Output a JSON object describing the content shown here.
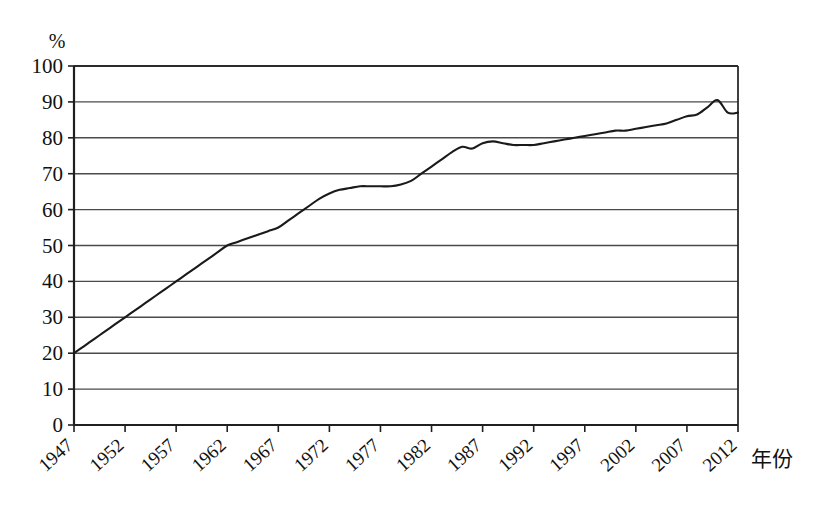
{
  "chart_data": {
    "type": "line",
    "title": "",
    "subtitle": "",
    "xlabel": "年份",
    "ylabel": "%",
    "unit_label": "%",
    "xlim": [
      1947,
      2012
    ],
    "ylim": [
      0,
      100
    ],
    "grid": true,
    "legend": false,
    "legend_position": "none",
    "y_ticks": [
      0,
      10,
      20,
      30,
      40,
      50,
      60,
      70,
      80,
      90,
      100
    ],
    "y_tick_labels": [
      "0",
      "10",
      "20",
      "30",
      "40",
      "50",
      "60",
      "70",
      "80",
      "90",
      "100"
    ],
    "x_ticks": [
      1947,
      1952,
      1957,
      1962,
      1967,
      1972,
      1977,
      1982,
      1987,
      1992,
      1997,
      2002,
      2007,
      2012
    ],
    "x_tick_labels": [
      "1947",
      "1952",
      "1957",
      "1962",
      "1967",
      "1972",
      "1977",
      "1982",
      "1987",
      "1992",
      "1997",
      "2002",
      "2007",
      "2012"
    ],
    "series": [
      {
        "name": "",
        "x": [
          1947,
          1948,
          1949,
          1950,
          1951,
          1952,
          1953,
          1954,
          1955,
          1956,
          1957,
          1958,
          1959,
          1960,
          1961,
          1962,
          1963,
          1964,
          1965,
          1966,
          1967,
          1968,
          1969,
          1970,
          1971,
          1972,
          1973,
          1974,
          1975,
          1976,
          1977,
          1978,
          1979,
          1980,
          1981,
          1982,
          1983,
          1984,
          1985,
          1986,
          1987,
          1988,
          1989,
          1990,
          1991,
          1992,
          1993,
          1994,
          1995,
          1996,
          1997,
          1998,
          1999,
          2000,
          2001,
          2002,
          2003,
          2004,
          2005,
          2006,
          2007,
          2008,
          2009,
          2010,
          2011,
          2012
        ],
        "values": [
          20,
          22,
          24,
          26,
          28,
          30,
          32,
          34,
          36,
          38,
          40,
          42,
          44,
          46,
          48,
          50,
          51,
          52,
          53,
          54,
          55,
          57,
          59,
          61,
          63,
          64.5,
          65.5,
          66,
          66.5,
          66.5,
          66.5,
          66.5,
          67,
          68,
          70,
          72,
          74,
          76,
          77.5,
          77,
          78.5,
          79,
          78.5,
          78,
          78,
          78,
          78.5,
          79,
          79.5,
          80,
          80.5,
          81,
          81.5,
          82,
          82,
          82.5,
          83,
          83.5,
          84,
          85,
          86,
          86.5,
          88.5,
          90.5,
          87,
          87
        ]
      }
    ],
    "annotations": []
  }
}
